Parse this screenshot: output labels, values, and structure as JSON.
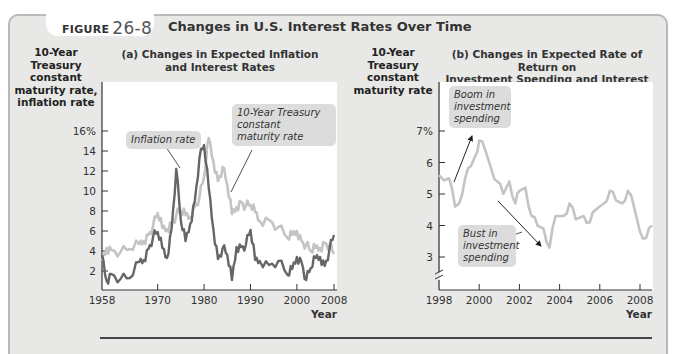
{
  "figure": {
    "label": "FIGURE",
    "number": "26-8",
    "title": "Changes in U.S. Interest Rates Over Time"
  },
  "panel_a": {
    "title_line1": "(a) Changes in Expected Inflation",
    "title_line2": "and Interest Rates",
    "ylabel_lines": [
      "10-Year",
      "Treasury",
      "constant",
      "maturity rate,",
      "inflation rate"
    ],
    "yticks": [
      "16%",
      "14",
      "12",
      "10",
      "8",
      "6",
      "4",
      "2"
    ],
    "xticks": [
      "1958",
      "1970",
      "1980",
      "1990",
      "2000",
      "2008"
    ],
    "xlabel": "Year",
    "annotation_inflation": "Inflation rate",
    "annotation_treasury_lines": [
      "10-Year Treasury",
      "constant",
      "maturity rate"
    ]
  },
  "panel_b": {
    "title_line1": "(b) Changes in Expected Rate of Return on",
    "title_line2": "Investment Spending and Interest Rates",
    "ylabel_lines": [
      "10-Year",
      "Treasury",
      "constant",
      "maturity rate"
    ],
    "yticks": [
      "7%",
      "6",
      "5",
      "4",
      "3"
    ],
    "xticks": [
      "1998",
      "2000",
      "2002",
      "2004",
      "2006",
      "2008"
    ],
    "xlabel": "Year",
    "annotation_boom_lines": [
      "Boom in",
      "investment",
      "spending"
    ],
    "annotation_bust_lines": [
      "Bust in",
      "investment",
      "spending"
    ]
  },
  "colors": {
    "treasury_line": "#c4c4c4",
    "inflation_line": "#666666",
    "panel_bg": "#e8e8e6",
    "plot_bg": "#ffffff"
  },
  "chart_data": [
    {
      "type": "line",
      "title": "(a) Changes in Expected Inflation and Interest Rates",
      "xlabel": "Year",
      "ylabel": "10-Year Treasury constant maturity rate, inflation rate",
      "xlim": [
        1958,
        2008.5
      ],
      "ylim": [
        0,
        16
      ],
      "grid": false,
      "legend": "inline annotations",
      "x": [
        1958,
        1959,
        1960,
        1962,
        1964,
        1966,
        1967,
        1968,
        1969,
        1970,
        1971,
        1972,
        1973,
        1974,
        1975,
        1976,
        1977,
        1978,
        1979,
        1980,
        1981,
        1982,
        1983,
        1984,
        1985,
        1986,
        1987,
        1988,
        1989,
        1990,
        1991,
        1992,
        1994,
        1996,
        1998,
        1999,
        2000,
        2001,
        2002,
        2003,
        2004,
        2005,
        2006,
        2007,
        2008
      ],
      "series": [
        {
          "name": "10-Year Treasury constant maturity rate",
          "values": [
            3.0,
            4.3,
            4.1,
            3.9,
            4.2,
            4.7,
            5.0,
            5.6,
            6.5,
            7.8,
            6.3,
            6.2,
            6.8,
            7.6,
            8.0,
            7.6,
            7.4,
            8.4,
            9.4,
            11.4,
            15.3,
            13.0,
            11.0,
            12.4,
            10.6,
            7.7,
            8.4,
            8.9,
            8.5,
            8.6,
            7.9,
            7.0,
            7.1,
            6.4,
            5.3,
            5.6,
            6.0,
            5.0,
            4.6,
            4.0,
            4.3,
            4.3,
            4.8,
            4.6,
            3.7
          ]
        },
        {
          "name": "Inflation rate",
          "values": [
            3.6,
            1.0,
            1.7,
            1.2,
            1.3,
            2.9,
            3.1,
            4.2,
            5.4,
            5.9,
            4.3,
            3.3,
            6.2,
            12.2,
            7.0,
            5.0,
            6.7,
            9.0,
            13.3,
            14.6,
            10.3,
            6.2,
            3.2,
            4.3,
            3.6,
            1.1,
            4.4,
            4.4,
            4.6,
            6.1,
            3.1,
            3.0,
            2.6,
            3.0,
            1.6,
            2.2,
            3.4,
            2.9,
            1.1,
            2.3,
            3.3,
            3.4,
            2.5,
            4.1,
            5.6
          ]
        }
      ]
    },
    {
      "type": "line",
      "title": "(b) Changes in Expected Rate of Return on Investment Spending and Interest Rates",
      "xlabel": "Year",
      "ylabel": "10-Year Treasury constant maturity rate",
      "xlim": [
        1998,
        2008.7
      ],
      "ylim": [
        2.3,
        7.5
      ],
      "grid": false,
      "x": [
        1998.0,
        1998.5,
        1998.8,
        1999.0,
        1999.3,
        1999.6,
        1999.8,
        2000.0,
        2000.3,
        2000.6,
        2000.9,
        2001.2,
        2001.5,
        2001.8,
        2002.0,
        2002.3,
        2002.6,
        2002.9,
        2003.2,
        2003.5,
        2003.8,
        2004.2,
        2004.5,
        2004.8,
        2005.2,
        2005.5,
        2005.8,
        2006.2,
        2006.5,
        2006.8,
        2007.1,
        2007.4,
        2007.7,
        2008.0,
        2008.3,
        2008.6
      ],
      "series": [
        {
          "name": "10-Year Treasury constant maturity rate",
          "values": [
            5.6,
            5.5,
            4.6,
            4.7,
            5.5,
            5.9,
            6.2,
            6.7,
            6.4,
            5.8,
            5.4,
            5.0,
            5.4,
            4.7,
            5.1,
            5.2,
            4.3,
            4.0,
            3.9,
            3.3,
            4.3,
            4.3,
            4.7,
            4.2,
            4.3,
            4.1,
            4.5,
            4.7,
            5.1,
            4.8,
            4.7,
            5.1,
            4.6,
            3.8,
            3.6,
            4.0
          ]
        }
      ],
      "annotations": [
        "Boom in investment spending",
        "Bust in investment spending"
      ]
    }
  ]
}
